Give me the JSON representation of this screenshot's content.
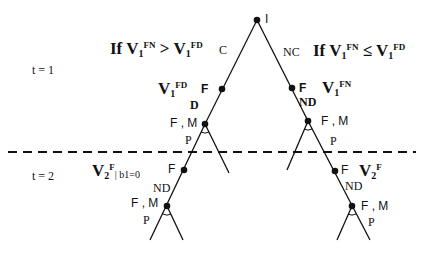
{
  "diagram": {
    "type": "game-tree",
    "time_labels": [
      {
        "text": "t = 1"
      },
      {
        "text": "t = 2"
      }
    ],
    "root": {
      "label": "I"
    },
    "actions": {
      "left": "C",
      "right": "NC",
      "lower_left": "D",
      "lower_right": "ND",
      "lower_left_t2": "ND",
      "lower_right_t2": "ND",
      "p_labels": [
        "P",
        "P",
        "P",
        "P"
      ]
    },
    "conditions": {
      "left": {
        "prefix": "If V",
        "sub1": "1",
        "sup1": "FN",
        "op": " > V",
        "sub2": "1",
        "sup2": "FD"
      },
      "right": {
        "prefix": "If V",
        "sub1": "1",
        "sup1": "FN",
        "op": " ≤ V",
        "sub2": "1",
        "sup2": "FD"
      }
    },
    "node_labels": {
      "f": "F",
      "fm": "F , M"
    },
    "values": {
      "left_t1": {
        "base": "V",
        "sub": "1",
        "sup": "FD"
      },
      "right_t1": {
        "base": "V",
        "sub": "1",
        "sup": "FN"
      },
      "left_t2": {
        "base": "V",
        "sub": "2",
        "sup": "F",
        "cond": "| b1=0"
      },
      "right_t2": {
        "base": "V",
        "sub": "2",
        "sup": "F"
      }
    },
    "separator": {
      "style": "dashed"
    }
  }
}
